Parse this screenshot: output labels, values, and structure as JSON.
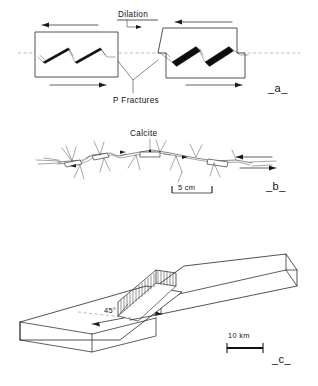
{
  "figure": {
    "kind": "geological-line-drawing",
    "background_color": "#ffffff",
    "ink_color": "#1a1a1a",
    "panels": [
      {
        "id": "a",
        "label": "_a_",
        "caption_labels": [
          "Dilation",
          "P Fractures"
        ],
        "description": "Two map-view shear zone boxes with P fractures and dilational veins"
      },
      {
        "id": "b",
        "label": "_b_",
        "caption_labels": [
          "Calcite",
          "5 cm"
        ],
        "description": "Natural fault trace with calcite filled dilational jogs"
      },
      {
        "id": "c",
        "label": "_c_",
        "caption_labels": [
          "45°",
          "10 km"
        ],
        "description": "Three dimensional block diagram of a pull-apart dilational jog"
      }
    ]
  },
  "panel_a": {
    "panel_label": "_a_",
    "dilation_label": "Dilation",
    "p_fractures_label": "P Fractures",
    "left_box": {
      "name": "low-dilation-shear-box",
      "vein_count": 2,
      "vein_style": "thin-solid",
      "top_arrow_direction": "left",
      "bottom_arrow_direction": "right",
      "shear_sense": "sinistral"
    },
    "right_box": {
      "name": "high-dilation-shear-box",
      "vein_count": 2,
      "vein_style": "thick-solid",
      "top_arrow_direction": "left",
      "bottom_arrow_direction": "right",
      "shear_sense": "sinistral"
    }
  },
  "panel_b": {
    "panel_label": "_b_",
    "calcite_label": "Calcite",
    "scale_label": "5 cm",
    "trace_description": "irregular fault trace with rhomb shaped calcite jogs and splay cracks",
    "jog_count": 4,
    "shear_sense": "dextral"
  },
  "panel_c": {
    "panel_label": "_c_",
    "angle_label": "45°",
    "scale_label": "10 km",
    "block_description": "two offset crustal slabs separated by a hatched dilational jog",
    "hatched_zone": "dilational-jog",
    "slab_count": 2
  }
}
